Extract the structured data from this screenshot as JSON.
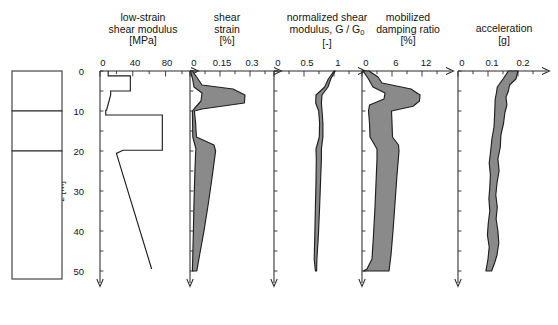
{
  "figure": {
    "depth_axis": {
      "label": "z [m]",
      "ticks": [
        0,
        10,
        20,
        30,
        40,
        50
      ],
      "minor_step": 5,
      "range": [
        0,
        53
      ]
    },
    "soil_profile": {
      "name": "soil-stratigraphy-column",
      "layers": [
        {
          "name": "clayey-silt-oc",
          "text": "clayey\nsilt\no.c.",
          "lines": [
            "clayey",
            "silt",
            "o.c."
          ],
          "top_m": 0,
          "bottom_m": 10
        },
        {
          "name": "sand",
          "text": "sand",
          "lines": [
            "sand"
          ],
          "top_m": 10,
          "bottom_m": 20
        },
        {
          "name": "clayey-silt-nc",
          "text": "clayey\nsilt\nn.c.",
          "lines": [
            "clayey",
            "silt",
            "n.c."
          ],
          "top_m": 20,
          "bottom_m": 52
        }
      ]
    },
    "fill_color": "#8a8a8a",
    "line_color": "#1f1f1f"
  },
  "chart_data": [
    {
      "type": "line",
      "name": "low-strain-shear-modulus",
      "title": "low-strain\nshear modulus\n[MPa]",
      "title_lines": [
        "low-strain",
        "shear modulus",
        "[MPa]"
      ],
      "xlabel": "low-strain shear modulus",
      "unit": "[MPa]",
      "ylabel": "z [m]",
      "xlim": [
        0,
        100
      ],
      "xticks": [
        0,
        40,
        80
      ],
      "xtick_labels": [
        "0",
        "40",
        "80"
      ],
      "xminor_step": 20,
      "ylim": [
        0,
        53
      ],
      "grid": false,
      "legend": "none",
      "series": [
        {
          "name": "G0",
          "style": "step-profile",
          "points": [
            {
              "z": 0,
              "x": 10
            },
            {
              "z": 1.2,
              "x": 10
            },
            {
              "z": 1.2,
              "x": 37
            },
            {
              "z": 5.0,
              "x": 37
            },
            {
              "z": 5.0,
              "x": 13
            },
            {
              "z": 6.0,
              "x": 13
            },
            {
              "z": 9.8,
              "x": 8
            },
            {
              "z": 9.8,
              "x": 7
            },
            {
              "z": 11.0,
              "x": 7
            },
            {
              "z": 11.0,
              "x": 76
            },
            {
              "z": 19.8,
              "x": 76
            },
            {
              "z": 19.8,
              "x": 28
            },
            {
              "z": 20.6,
              "x": 20
            },
            {
              "z": 49.5,
              "x": 63
            }
          ]
        }
      ]
    },
    {
      "type": "area",
      "name": "shear-strain",
      "title": "shear\nstrain\n[%]",
      "title_lines": [
        "shear",
        "strain",
        "[%]"
      ],
      "xlabel": "shear strain",
      "unit": "[%]",
      "ylabel": "z [m]",
      "xlim": [
        0,
        0.375
      ],
      "xticks": [
        0,
        0.15,
        0.3
      ],
      "xtick_labels": [
        "0",
        "0.15",
        "0.3"
      ],
      "xminor_step": 0.075,
      "ylim": [
        0,
        53
      ],
      "grid": false,
      "legend": "none",
      "band": {
        "lower": [
          {
            "z": 0,
            "x": 0.002
          },
          {
            "z": 2.0,
            "x": 0.013
          },
          {
            "z": 4.0,
            "x": 0.02
          },
          {
            "z": 5.5,
            "x": 0.06
          },
          {
            "z": 7.5,
            "x": 0.055
          },
          {
            "z": 9.5,
            "x": 0.02
          },
          {
            "z": 10.0,
            "x": 0.012
          },
          {
            "z": 13.0,
            "x": 0.013
          },
          {
            "z": 16.5,
            "x": 0.014
          },
          {
            "z": 19.5,
            "x": 0.03
          },
          {
            "z": 20.5,
            "x": 0.028
          },
          {
            "z": 26.0,
            "x": 0.024
          },
          {
            "z": 33.0,
            "x": 0.02
          },
          {
            "z": 40.0,
            "x": 0.017
          },
          {
            "z": 46.0,
            "x": 0.014
          },
          {
            "z": 50.0,
            "x": 0.012
          }
        ],
        "upper": [
          {
            "z": 0,
            "x": 0.012
          },
          {
            "z": 2.0,
            "x": 0.04
          },
          {
            "z": 3.5,
            "x": 0.06
          },
          {
            "z": 4.5,
            "x": 0.215
          },
          {
            "z": 6.0,
            "x": 0.275
          },
          {
            "z": 8.0,
            "x": 0.272
          },
          {
            "z": 9.5,
            "x": 0.06
          },
          {
            "z": 10.0,
            "x": 0.022
          },
          {
            "z": 13.0,
            "x": 0.028
          },
          {
            "z": 16.5,
            "x": 0.032
          },
          {
            "z": 18.5,
            "x": 0.12
          },
          {
            "z": 20.0,
            "x": 0.128
          },
          {
            "z": 26.0,
            "x": 0.112
          },
          {
            "z": 33.0,
            "x": 0.092
          },
          {
            "z": 40.0,
            "x": 0.07
          },
          {
            "z": 46.0,
            "x": 0.048
          },
          {
            "z": 50.0,
            "x": 0.034
          }
        ]
      }
    },
    {
      "type": "area",
      "name": "normalized-shear-modulus",
      "title": "normalized shear\nmodulus, G / G0\n[-]",
      "title_lines": [
        "normalized shear",
        "modulus, G / G",
        "[-]"
      ],
      "title_subscript": "0",
      "xlabel": "normalized shear modulus, G / G0",
      "unit": "[-]",
      "ylabel": "z [m]",
      "xlim": [
        0,
        1.25
      ],
      "xticks": [
        0,
        0.5,
        1
      ],
      "xtick_labels": [
        "0",
        "0.5",
        "1"
      ],
      "xminor_step": 0.25,
      "ylim": [
        0,
        53
      ],
      "grid": false,
      "legend": "none",
      "band": {
        "lower": [
          {
            "z": 0,
            "x": 1.0
          },
          {
            "z": 2.0,
            "x": 0.905
          },
          {
            "z": 4.0,
            "x": 0.845
          },
          {
            "z": 6.0,
            "x": 0.7
          },
          {
            "z": 8.0,
            "x": 0.695
          },
          {
            "z": 10.0,
            "x": 0.745
          },
          {
            "z": 13.0,
            "x": 0.76
          },
          {
            "z": 16.5,
            "x": 0.755
          },
          {
            "z": 19.5,
            "x": 0.7
          },
          {
            "z": 22.0,
            "x": 0.705
          },
          {
            "z": 28.0,
            "x": 0.7
          },
          {
            "z": 34.0,
            "x": 0.69
          },
          {
            "z": 41.0,
            "x": 0.68
          },
          {
            "z": 47.0,
            "x": 0.67
          },
          {
            "z": 50.0,
            "x": 0.69
          }
        ],
        "upper": [
          {
            "z": 0,
            "x": 1.02
          },
          {
            "z": 2.0,
            "x": 0.945
          },
          {
            "z": 4.0,
            "x": 0.9
          },
          {
            "z": 6.0,
            "x": 0.8
          },
          {
            "z": 8.0,
            "x": 0.79
          },
          {
            "z": 10.0,
            "x": 0.8
          },
          {
            "z": 13.0,
            "x": 0.815
          },
          {
            "z": 16.5,
            "x": 0.815
          },
          {
            "z": 19.5,
            "x": 0.79
          },
          {
            "z": 22.0,
            "x": 0.79
          },
          {
            "z": 28.0,
            "x": 0.775
          },
          {
            "z": 34.0,
            "x": 0.76
          },
          {
            "z": 41.0,
            "x": 0.74
          },
          {
            "z": 47.0,
            "x": 0.715
          },
          {
            "z": 50.0,
            "x": 0.71
          }
        ]
      }
    },
    {
      "type": "area",
      "name": "mobilized-damping-ratio",
      "title": "mobilized\ndamping ratio\n[%]",
      "title_lines": [
        "mobilized",
        "damping ratio",
        "[%]"
      ],
      "xlabel": "mobilized damping ratio",
      "unit": "[%]",
      "ylabel": "z [m]",
      "xlim": [
        0,
        15
      ],
      "xticks": [
        0,
        6,
        12
      ],
      "xtick_labels": [
        "0",
        "6",
        "12"
      ],
      "xminor_step": 3,
      "ylim": [
        0,
        53
      ],
      "grid": false,
      "legend": "none",
      "band": {
        "lower": [
          {
            "z": 0,
            "x": 0.2
          },
          {
            "z": 2.0,
            "x": 1.3
          },
          {
            "z": 4.0,
            "x": 2.2
          },
          {
            "z": 5.5,
            "x": 4.6
          },
          {
            "z": 7.0,
            "x": 4.4
          },
          {
            "z": 8.5,
            "x": 1.5
          },
          {
            "z": 10.0,
            "x": 1.3
          },
          {
            "z": 13.0,
            "x": 1.5
          },
          {
            "z": 16.5,
            "x": 1.6
          },
          {
            "z": 19.5,
            "x": 3.0
          },
          {
            "z": 22.0,
            "x": 3.0
          },
          {
            "z": 28.0,
            "x": 2.8
          },
          {
            "z": 34.0,
            "x": 2.6
          },
          {
            "z": 41.0,
            "x": 2.3
          },
          {
            "z": 47.0,
            "x": 2.0
          },
          {
            "z": 49.5,
            "x": 1.0
          },
          {
            "z": 50.0,
            "x": 0.3
          }
        ],
        "upper": [
          {
            "z": 0,
            "x": 1.4
          },
          {
            "z": 1.5,
            "x": 3.2
          },
          {
            "z": 3.0,
            "x": 4.0
          },
          {
            "z": 4.5,
            "x": 9.8
          },
          {
            "z": 6.0,
            "x": 11.6
          },
          {
            "z": 7.5,
            "x": 11.5
          },
          {
            "z": 8.8,
            "x": 10.2
          },
          {
            "z": 10.0,
            "x": 5.9
          },
          {
            "z": 13.0,
            "x": 6.0
          },
          {
            "z": 16.5,
            "x": 6.1
          },
          {
            "z": 18.5,
            "x": 7.3
          },
          {
            "z": 20.0,
            "x": 7.4
          },
          {
            "z": 26.0,
            "x": 7.0
          },
          {
            "z": 33.0,
            "x": 6.6
          },
          {
            "z": 40.0,
            "x": 6.2
          },
          {
            "z": 46.0,
            "x": 5.8
          },
          {
            "z": 50.0,
            "x": 5.4
          }
        ]
      }
    },
    {
      "type": "area",
      "name": "acceleration",
      "title": "acceleration\n[g]",
      "title_lines": [
        "acceleration",
        "[g]"
      ],
      "xlabel": "acceleration",
      "unit": "[g]",
      "ylabel": "z [m]",
      "xlim": [
        0,
        0.25
      ],
      "xticks": [
        0,
        0.1,
        0.2
      ],
      "xtick_labels": [
        "0",
        "0.1",
        "0.2"
      ],
      "xminor_step": 0.05,
      "ylim": [
        0,
        53
      ],
      "grid": false,
      "legend": "none",
      "band": {
        "lower": [
          {
            "z": 0,
            "x": 0.168
          },
          {
            "z": 2.0,
            "x": 0.15
          },
          {
            "z": 4.0,
            "x": 0.131
          },
          {
            "z": 5.5,
            "x": 0.128
          },
          {
            "z": 7.0,
            "x": 0.124
          },
          {
            "z": 9.0,
            "x": 0.123
          },
          {
            "z": 11.0,
            "x": 0.122
          },
          {
            "z": 14.0,
            "x": 0.12
          },
          {
            "z": 17.0,
            "x": 0.113
          },
          {
            "z": 20.0,
            "x": 0.109
          },
          {
            "z": 23.0,
            "x": 0.104
          },
          {
            "z": 26.0,
            "x": 0.108
          },
          {
            "z": 29.0,
            "x": 0.106
          },
          {
            "z": 32.0,
            "x": 0.103
          },
          {
            "z": 35.0,
            "x": 0.106
          },
          {
            "z": 38.0,
            "x": 0.101
          },
          {
            "z": 41.0,
            "x": 0.098
          },
          {
            "z": 44.0,
            "x": 0.104
          },
          {
            "z": 47.0,
            "x": 0.1
          },
          {
            "z": 50.0,
            "x": 0.093
          }
        ],
        "upper": [
          {
            "z": 0,
            "x": 0.2
          },
          {
            "z": 2.0,
            "x": 0.193
          },
          {
            "z": 3.5,
            "x": 0.172
          },
          {
            "z": 5.0,
            "x": 0.168
          },
          {
            "z": 6.5,
            "x": 0.16
          },
          {
            "z": 8.5,
            "x": 0.163
          },
          {
            "z": 10.5,
            "x": 0.156
          },
          {
            "z": 13.0,
            "x": 0.152
          },
          {
            "z": 16.0,
            "x": 0.143
          },
          {
            "z": 19.0,
            "x": 0.141
          },
          {
            "z": 22.0,
            "x": 0.133
          },
          {
            "z": 25.0,
            "x": 0.137
          },
          {
            "z": 28.0,
            "x": 0.13
          },
          {
            "z": 31.0,
            "x": 0.126
          },
          {
            "z": 34.0,
            "x": 0.131
          },
          {
            "z": 37.0,
            "x": 0.127
          },
          {
            "z": 40.0,
            "x": 0.133
          },
          {
            "z": 43.0,
            "x": 0.136
          },
          {
            "z": 46.0,
            "x": 0.13
          },
          {
            "z": 48.0,
            "x": 0.122
          },
          {
            "z": 50.0,
            "x": 0.112
          }
        ]
      }
    }
  ]
}
